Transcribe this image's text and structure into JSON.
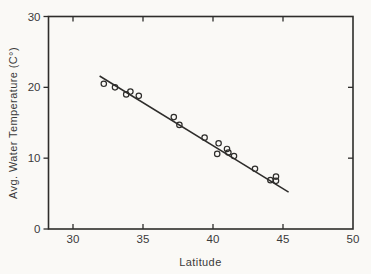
{
  "figure": {
    "background": "#faf9f6",
    "line_color": "#2e2d2b",
    "text_color": "#3a3a3a",
    "marker_style": "open-circle"
  },
  "chart_data": {
    "type": "scatter",
    "title": "",
    "xlabel": "Latitude",
    "ylabel": "Avg. Water Temperature (C°)",
    "xlim": [
      28.25,
      50
    ],
    "ylim": [
      0,
      30
    ],
    "x_ticks": [
      30,
      35,
      40,
      45,
      50
    ],
    "y_ticks": [
      0,
      10,
      20,
      30
    ],
    "grid": false,
    "legend": null,
    "points": [
      [
        32.2,
        20.5
      ],
      [
        33.0,
        20.0
      ],
      [
        33.8,
        19.0
      ],
      [
        34.1,
        19.4
      ],
      [
        34.7,
        18.8
      ],
      [
        37.2,
        15.8
      ],
      [
        37.6,
        14.7
      ],
      [
        39.4,
        12.9
      ],
      [
        40.3,
        10.6
      ],
      [
        40.4,
        12.1
      ],
      [
        41.0,
        11.3
      ],
      [
        41.1,
        10.8
      ],
      [
        41.5,
        10.3
      ],
      [
        43.0,
        8.5
      ],
      [
        44.1,
        6.9
      ],
      [
        44.5,
        7.4
      ],
      [
        44.5,
        6.8
      ]
    ],
    "fit_line": {
      "x1": 31.9,
      "y1": 21.6,
      "x2": 45.4,
      "y2": 5.2
    }
  }
}
